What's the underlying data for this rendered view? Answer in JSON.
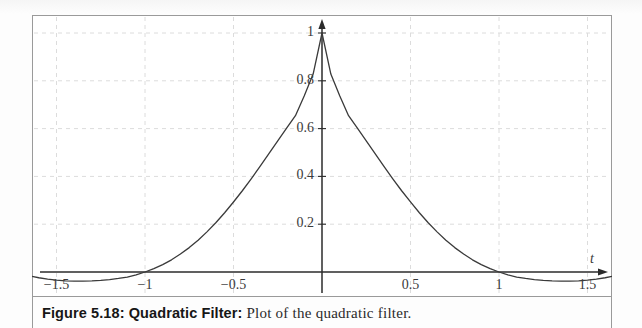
{
  "figure": {
    "caption_label": "Figure 5.18: Quadratic Filter:",
    "caption_text": "Plot of the quadratic filter.",
    "border_color": "#9a9a9a",
    "background": "#ffffff"
  },
  "chart_data": {
    "type": "line",
    "title": "",
    "subtitle": "",
    "xlabel": "t",
    "ylabel": "",
    "xlim": [
      -1.72,
      1.78
    ],
    "ylim": [
      -0.075,
      1.1
    ],
    "grid": true,
    "grid_style": "dashed",
    "grid_color": "#dcdcdc",
    "legend": "none",
    "line_color": "#3a3a3a",
    "line_width": 1.3,
    "axis_color": "#2b2b2b",
    "x_ticks": [
      -1.5,
      -1,
      -0.5,
      0.5,
      1,
      1.5
    ],
    "x_tick_labels": [
      "−1.5",
      "−1",
      "−0.5",
      "0.5",
      "1",
      "1.5"
    ],
    "y_ticks": [
      0.2,
      0.4,
      0.6,
      0.8,
      1
    ],
    "y_tick_labels": [
      "0.2",
      "0.4",
      "0.6",
      "0.8",
      "1"
    ],
    "x_grid_values": [
      -1.5,
      -1,
      -0.5,
      0.5,
      1,
      1.5
    ],
    "y_grid_values": [
      0.2,
      0.4,
      0.6,
      0.8,
      1
    ],
    "annotations": [],
    "series": [
      {
        "name": "quadratic filter",
        "description": "Symmetric bell-shaped quadratic/raised-cosine filter, peak value 1 at t = 0, zero crossings at t = ±1, shallow negative side lobes with minimum near −0.035 at t ≈ ±1.22.",
        "x": [
          -1.75,
          -1.7,
          -1.65,
          -1.6,
          -1.55,
          -1.5,
          -1.45,
          -1.4,
          -1.35,
          -1.3,
          -1.25,
          -1.2,
          -1.15,
          -1.1,
          -1.05,
          -1.0,
          -0.95,
          -0.9,
          -0.85,
          -0.8,
          -0.75,
          -0.7,
          -0.65,
          -0.6,
          -0.55,
          -0.5,
          -0.45,
          -0.4,
          -0.35,
          -0.3,
          -0.25,
          -0.2,
          -0.15,
          -0.1,
          -0.05,
          0.0,
          0.05,
          0.1,
          0.15,
          0.2,
          0.25,
          0.3,
          0.35,
          0.4,
          0.45,
          0.5,
          0.55,
          0.6,
          0.65,
          0.7,
          0.75,
          0.8,
          0.85,
          0.9,
          0.95,
          1.0,
          1.05,
          1.1,
          1.15,
          1.2,
          1.25,
          1.3,
          1.35,
          1.4,
          1.45,
          1.5,
          1.55,
          1.6,
          1.65,
          1.7,
          1.75
        ],
        "y": [
          0.0,
          -0.009,
          -0.017,
          -0.024,
          -0.03,
          -0.034,
          -0.037,
          -0.038,
          -0.038,
          -0.037,
          -0.035,
          -0.032,
          -0.027,
          -0.021,
          -0.012,
          0.0,
          0.014,
          0.031,
          0.051,
          0.075,
          0.102,
          0.133,
          0.168,
          0.206,
          0.248,
          0.293,
          0.34,
          0.39,
          0.442,
          0.495,
          0.549,
          0.602,
          0.654,
          0.737,
          0.828,
          1.0,
          0.828,
          0.737,
          0.654,
          0.602,
          0.549,
          0.495,
          0.442,
          0.39,
          0.34,
          0.293,
          0.248,
          0.206,
          0.168,
          0.133,
          0.102,
          0.075,
          0.051,
          0.031,
          0.014,
          0.0,
          -0.012,
          -0.021,
          -0.027,
          -0.032,
          -0.035,
          -0.037,
          -0.038,
          -0.038,
          -0.037,
          -0.034,
          -0.03,
          -0.024,
          -0.017,
          -0.009,
          0.0
        ]
      }
    ],
    "key_points": {
      "peak": {
        "t": 0,
        "value": 1
      },
      "zero_crossings": [
        -1,
        1
      ],
      "side_lobe_minimum": {
        "t": 1.22,
        "value": -0.038
      },
      "half_amplitude": {
        "t": 0.35,
        "value": 0.5
      }
    }
  }
}
